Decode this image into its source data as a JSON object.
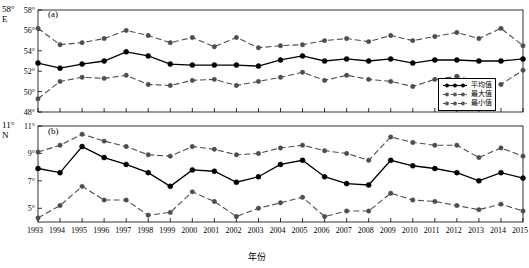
{
  "chart_data": [
    {
      "type": "line",
      "panel_tag": "(a)",
      "ylabel": "58°\nE",
      "xlabel": "",
      "ylim": [
        48,
        58
      ],
      "yticks": [
        48,
        50,
        52,
        54,
        56,
        58
      ],
      "ytick_labels": [
        "48°",
        "50°",
        "52°",
        "54°",
        "56°",
        "58°"
      ],
      "grid": false,
      "x": [
        1993,
        1994,
        1995,
        1996,
        1997,
        1998,
        1999,
        2000,
        2001,
        2002,
        2003,
        2004,
        2005,
        2006,
        2007,
        2008,
        2009,
        2010,
        2011,
        2012,
        2013,
        2014,
        2015
      ],
      "series": [
        {
          "name": "平均值",
          "values": [
            52.8,
            52.3,
            52.7,
            53.0,
            53.9,
            53.5,
            52.7,
            52.6,
            52.6,
            52.6,
            52.5,
            53.1,
            53.5,
            53.0,
            53.2,
            53.0,
            53.2,
            52.8,
            53.1,
            53.1,
            53.0,
            53.0,
            53.2
          ]
        },
        {
          "name": "最大值",
          "values": [
            56.2,
            54.6,
            54.8,
            55.2,
            56.0,
            55.5,
            54.8,
            55.3,
            54.4,
            55.3,
            54.3,
            54.5,
            54.6,
            55.0,
            55.2,
            54.9,
            55.5,
            55.0,
            55.4,
            55.8,
            55.2,
            56.2,
            54.5
          ]
        },
        {
          "name": "最小值",
          "values": [
            49.3,
            51.0,
            51.4,
            51.3,
            51.6,
            50.7,
            50.6,
            51.1,
            51.2,
            50.6,
            51.0,
            51.4,
            51.9,
            51.1,
            51.6,
            51.2,
            51.0,
            50.5,
            51.2,
            51.5,
            51.0,
            50.7,
            52.1
          ]
        }
      ]
    },
    {
      "type": "line",
      "panel_tag": "(b)",
      "ylabel": "11°\nN",
      "xlabel": "年份",
      "ylim": [
        4,
        11
      ],
      "yticks": [
        5,
        7,
        9,
        11
      ],
      "ytick_labels": [
        "5°",
        "7°",
        "9°",
        "11°"
      ],
      "grid": false,
      "x": [
        1993,
        1994,
        1995,
        1996,
        1997,
        1998,
        1999,
        2000,
        2001,
        2002,
        2003,
        2004,
        2005,
        2006,
        2007,
        2008,
        2009,
        2010,
        2011,
        2012,
        2013,
        2014,
        2015
      ],
      "series": [
        {
          "name": "平均值",
          "values": [
            7.9,
            7.6,
            9.5,
            8.7,
            8.2,
            7.6,
            6.6,
            7.8,
            7.7,
            6.9,
            7.3,
            8.2,
            8.5,
            7.3,
            6.8,
            6.7,
            8.5,
            8.1,
            7.9,
            7.6,
            7.0,
            7.6,
            7.2
          ]
        },
        {
          "name": "最大值",
          "values": [
            9.1,
            9.6,
            10.4,
            9.9,
            9.5,
            8.9,
            8.8,
            9.5,
            9.3,
            8.9,
            9.0,
            9.4,
            9.6,
            9.2,
            9.0,
            8.5,
            10.2,
            9.8,
            9.6,
            9.6,
            8.7,
            9.4,
            8.8
          ]
        },
        {
          "name": "最小值",
          "values": [
            4.3,
            5.2,
            6.6,
            5.6,
            5.6,
            4.5,
            4.7,
            6.2,
            5.5,
            4.4,
            5.0,
            5.4,
            5.8,
            4.4,
            4.8,
            4.8,
            6.1,
            5.6,
            5.5,
            5.2,
            4.9,
            5.3,
            4.8
          ]
        }
      ]
    }
  ],
  "legend": {
    "items": [
      {
        "label": "平均值",
        "style": "solid",
        "color": "#000000"
      },
      {
        "label": "最大值",
        "style": "dashed",
        "color": "#555555"
      },
      {
        "label": "最小值",
        "style": "dashed",
        "color": "#555555"
      }
    ]
  },
  "xaxis": {
    "title": "年份",
    "tick_labels": [
      "1993",
      "1994",
      "1995",
      "1996",
      "1997",
      "1998",
      "1999",
      "2000",
      "2001",
      "2002",
      "2003",
      "2004",
      "2005",
      "2006",
      "2007",
      "2008",
      "2009",
      "2010",
      "2011",
      "2012",
      "2013",
      "2014",
      "2015"
    ]
  },
  "colors": {
    "mean_line": "#000000",
    "band_line": "#555555",
    "axis": "#000000",
    "background": "#ffffff"
  }
}
